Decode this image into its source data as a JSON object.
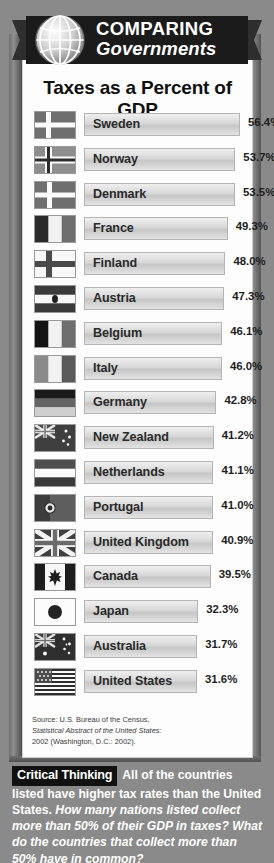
{
  "banner": {
    "line1": "COMPARING",
    "line2": "Governments",
    "globe_icon": "globe-icon"
  },
  "chart_title": "Taxes as a Percent of GDP",
  "source": {
    "line1": "Source: U.S. Bureau of the Census,",
    "line2": "Statistical Abstract of the United States:",
    "line3": "2002 (Washington, D.C.: 2002)."
  },
  "critical_thinking": {
    "badge": "Critical Thinking",
    "statement": "All of the countries listed have higher tax rates than the United States.",
    "question": "How many nations listed collect more than 50% of their GDP in taxes? What do the countries that collect more than 50% have in common?"
  },
  "chart_data": {
    "type": "bar",
    "orientation": "horizontal",
    "title": "Taxes as a Percent of GDP",
    "xlabel": "",
    "ylabel": "",
    "unit": "%",
    "xlim": [
      0,
      56.4
    ],
    "grid": false,
    "legend": false,
    "categories": [
      "Sweden",
      "Norway",
      "Denmark",
      "France",
      "Finland",
      "Austria",
      "Belgium",
      "Italy",
      "Germany",
      "New Zealand",
      "Netherlands",
      "Portugal",
      "United Kingdom",
      "Canada",
      "Japan",
      "Australia",
      "United States"
    ],
    "values": [
      56.4,
      53.7,
      53.5,
      49.3,
      48.0,
      47.3,
      46.1,
      46.0,
      42.8,
      41.2,
      41.1,
      41.0,
      40.9,
      39.5,
      32.3,
      31.7,
      31.6
    ],
    "value_labels": [
      "56.4%",
      "53.7%",
      "53.5%",
      "49.3%",
      "48.0%",
      "47.3%",
      "46.1%",
      "46.0%",
      "42.8%",
      "41.2%",
      "41.1%",
      "41.0%",
      "40.9%",
      "39.5%",
      "32.3%",
      "31.7%",
      "31.6%"
    ],
    "rows": [
      {
        "country": "Sweden",
        "value": 56.4,
        "label": "56.4%",
        "flag": "flag-sweden"
      },
      {
        "country": "Norway",
        "value": 53.7,
        "label": "53.7%",
        "flag": "flag-norway"
      },
      {
        "country": "Denmark",
        "value": 53.5,
        "label": "53.5%",
        "flag": "flag-denmark"
      },
      {
        "country": "France",
        "value": 49.3,
        "label": "49.3%",
        "flag": "flag-france"
      },
      {
        "country": "Finland",
        "value": 48.0,
        "label": "48.0%",
        "flag": "flag-finland"
      },
      {
        "country": "Austria",
        "value": 47.3,
        "label": "47.3%",
        "flag": "flag-austria"
      },
      {
        "country": "Belgium",
        "value": 46.1,
        "label": "46.1%",
        "flag": "flag-belgium"
      },
      {
        "country": "Italy",
        "value": 46.0,
        "label": "46.0%",
        "flag": "flag-italy"
      },
      {
        "country": "Germany",
        "value": 42.8,
        "label": "42.8%",
        "flag": "flag-germany"
      },
      {
        "country": "New Zealand",
        "value": 41.2,
        "label": "41.2%",
        "flag": "flag-new-zealand"
      },
      {
        "country": "Netherlands",
        "value": 41.1,
        "label": "41.1%",
        "flag": "flag-netherlands"
      },
      {
        "country": "Portugal",
        "value": 41.0,
        "label": "41.0%",
        "flag": "flag-portugal"
      },
      {
        "country": "United Kingdom",
        "value": 40.9,
        "label": "40.9%",
        "flag": "flag-united-kingdom"
      },
      {
        "country": "Canada",
        "value": 39.5,
        "label": "39.5%",
        "flag": "flag-canada"
      },
      {
        "country": "Japan",
        "value": 32.3,
        "label": "32.3%",
        "flag": "flag-japan"
      },
      {
        "country": "Australia",
        "value": 31.7,
        "label": "31.7%",
        "flag": "flag-australia"
      },
      {
        "country": "United States",
        "value": 31.6,
        "label": "31.6%",
        "flag": "flag-united-states"
      }
    ]
  },
  "colors": {
    "frame": "#7d7d7d",
    "panel": "#fdfdfd",
    "banner": "#1b1b1b",
    "bar_fill": "#d7d7d7",
    "text": "#1d1d1d"
  }
}
